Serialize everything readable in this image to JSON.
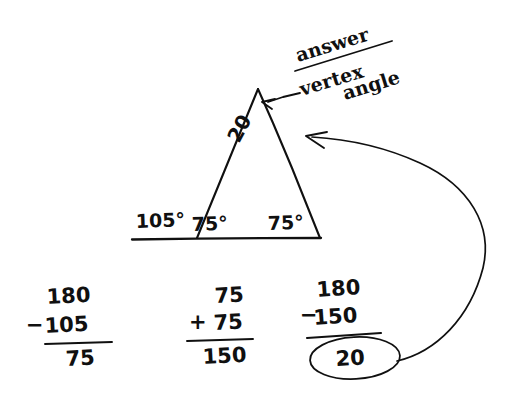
{
  "page": {
    "background_color": "#ffffff",
    "ink_color": "#101010"
  },
  "triangle": {
    "name": "isosceles-triangle",
    "exterior_angle_label": "105°",
    "base_left_angle_label": "75°",
    "base_right_angle_label": "75°",
    "vertex_angle_label": "20",
    "apex": {
      "x": 258,
      "y": 89
    },
    "base_left": {
      "x": 196,
      "y": 238
    },
    "base_right": {
      "x": 320,
      "y": 238
    },
    "baseline_start": {
      "x": 132,
      "y": 239
    },
    "baseline_end": {
      "x": 322,
      "y": 238
    }
  },
  "annotation": {
    "answer_label": "answer",
    "vertex_word": "vertex",
    "angle_word": "angle"
  },
  "calculations": [
    {
      "name": "supplementary-angle",
      "operator": "−",
      "top": "180",
      "bottom": "105",
      "result": "75",
      "circled": false
    },
    {
      "name": "sum-of-base-angles",
      "operator": "+",
      "top": "75",
      "bottom": "75",
      "result": "150",
      "circled": false
    },
    {
      "name": "vertex-angle",
      "operator": "−",
      "top": "180",
      "bottom": "150",
      "result": "20",
      "circled": true
    }
  ]
}
